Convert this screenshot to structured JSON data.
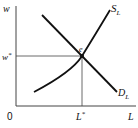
{
  "diagram": {
    "axes": {
      "y_label": "w",
      "x_label": "L",
      "origin_label": "0"
    },
    "curves": {
      "supply": {
        "label": "S",
        "subscript": "L"
      },
      "demand": {
        "label": "D",
        "subscript": "L"
      }
    },
    "equilibrium": {
      "point_label": "e",
      "wage_label": "w",
      "wage_marker": "*",
      "quantity_label": "L",
      "quantity_marker": "*"
    },
    "colors": {
      "line": "#111111",
      "guide": "#333333",
      "background": "#ffffff"
    }
  }
}
